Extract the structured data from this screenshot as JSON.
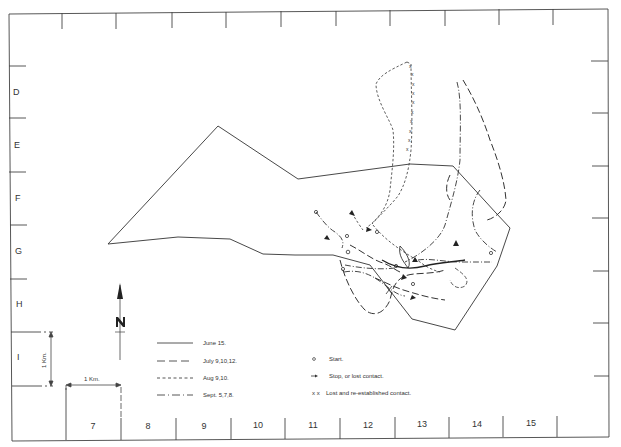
{
  "map": {
    "grid": {
      "row_labels": [
        "D",
        "E",
        "F",
        "G",
        "H",
        "I"
      ],
      "column_labels": [
        "7",
        "8",
        "9",
        "10",
        "11",
        "12",
        "13",
        "14",
        "15"
      ]
    },
    "north_arrow": {
      "label": "N"
    },
    "scale": {
      "horizontal_label": "1 Km.",
      "vertical_label": "1 Km."
    },
    "legend": {
      "line_styles": [
        {
          "style": "solid",
          "label": "June 15."
        },
        {
          "style": "long-dash",
          "label": "July  9,10,12."
        },
        {
          "style": "short-dash",
          "label": "Aug  9,10."
        },
        {
          "style": "dash-dot",
          "label": "Sept. 5,7,8."
        }
      ],
      "symbols": [
        {
          "symbol": "o",
          "label": "Start."
        },
        {
          "symbol": "→",
          "label": "Stop, or lost  contact."
        },
        {
          "symbol": "x x",
          "label": "Lost  and  re-established  contact."
        }
      ]
    },
    "colors": {
      "ink": "#333333",
      "background": "#ffffff"
    }
  }
}
